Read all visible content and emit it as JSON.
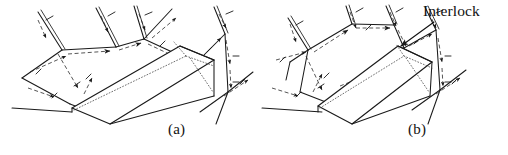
{
  "figure": {
    "type": "line-drawing",
    "background_color": "#ffffff",
    "ink_color": "#1a1a1a",
    "width": 508,
    "height": 155
  },
  "panels": [
    {
      "id": "a",
      "label": "(a)",
      "label_position": {
        "x": 168,
        "y": 121
      },
      "center_x": 127,
      "has_interlock_callout": false
    },
    {
      "id": "b",
      "label": "(b)",
      "label_position": {
        "x": 408,
        "y": 121
      },
      "center_x": 381,
      "has_interlock_callout": true
    }
  ],
  "annotations": [
    {
      "id": "interlock",
      "text": "Interlock",
      "panel": "b",
      "label_position": {
        "x": 423,
        "y": 2
      },
      "leader_from": {
        "x": 434,
        "y": 22
      },
      "leader_to": {
        "x": 399,
        "y": 47
      },
      "arrow": true
    }
  ],
  "legend_keys": {
    "solid_line": "visible fracture trace / block edge",
    "dashed_line_with_arrow": "slip direction indicator",
    "dotted_line": "hidden edge of block",
    "tick_mark": "dip / slip tick"
  },
  "colors": {
    "ink": "#1a1a1a",
    "dashed_ink": "#2b2b2b",
    "dotted_ink": "#4a4a4a",
    "background": "#ffffff"
  }
}
